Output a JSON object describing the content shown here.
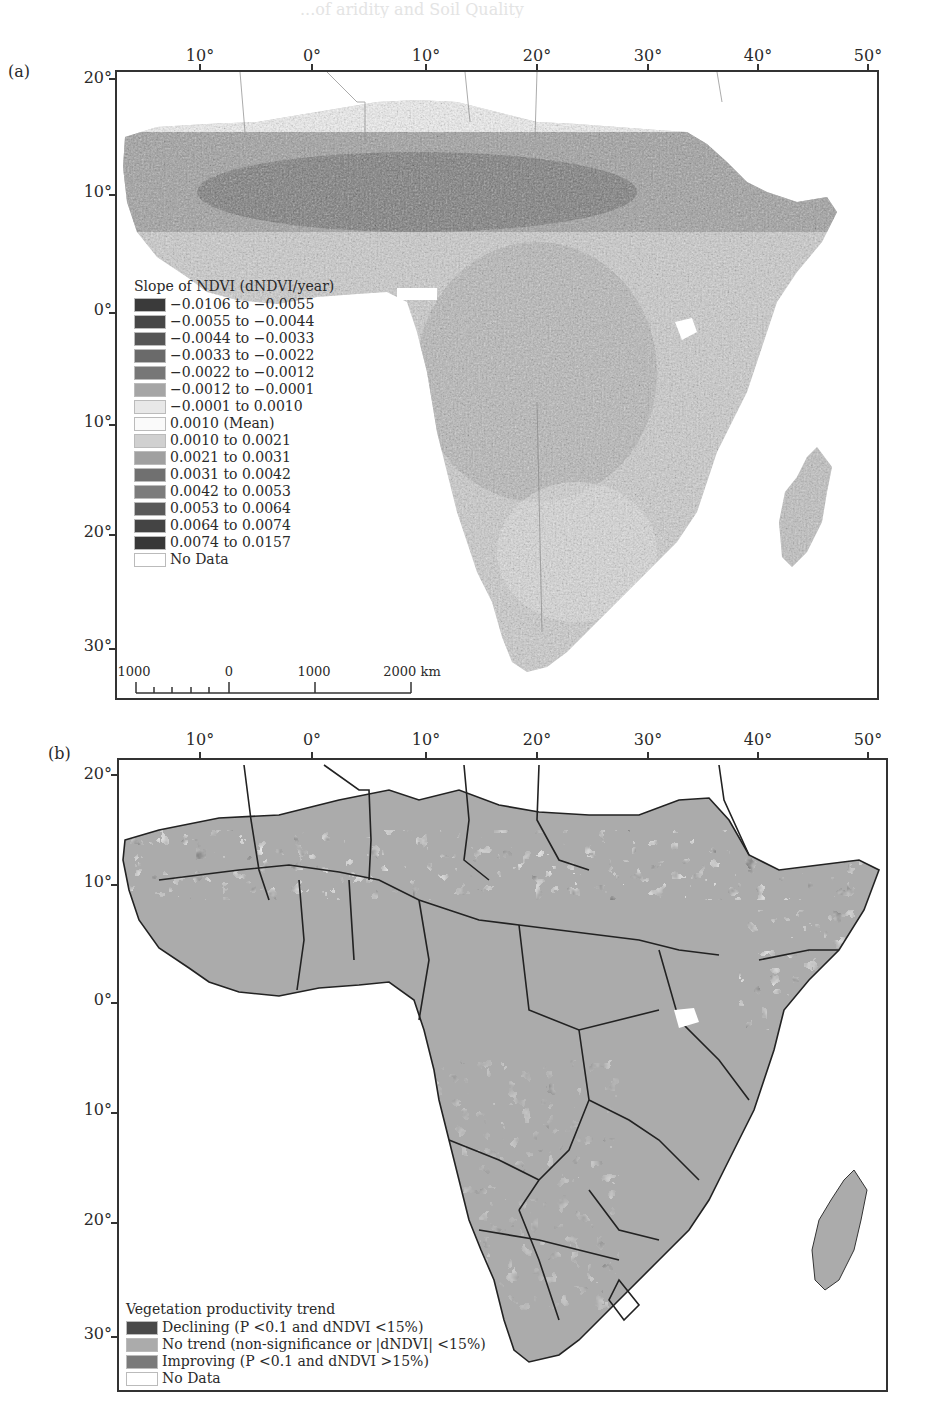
{
  "header_ghost_text": "...of aridity and Soil Quality",
  "panels": [
    {
      "id": "a",
      "label": "(a)",
      "lon_ticks": [
        "10°",
        "0°",
        "10°",
        "20°",
        "30°",
        "40°",
        "50°"
      ],
      "lat_ticks": [
        "20°",
        "10°",
        "0°",
        "10°",
        "20°",
        "30°"
      ],
      "legend": {
        "title": "Slope of NDVI (dNDVI/year)",
        "items": [
          {
            "label": "−0.0106 to −0.0055",
            "color": "#3a3a3a"
          },
          {
            "label": "−0.0055 to −0.0044",
            "color": "#474747"
          },
          {
            "label": "−0.0044 to −0.0033",
            "color": "#565656"
          },
          {
            "label": "−0.0033 to −0.0022",
            "color": "#6a6a6a"
          },
          {
            "label": "−0.0022 to −0.0012",
            "color": "#777777"
          },
          {
            "label": "−0.0012 to −0.0001",
            "color": "#a5a5a5"
          },
          {
            "label": "−0.0001 to 0.0010",
            "color": "#e8e8e8"
          },
          {
            "label": "0.0010 (Mean)",
            "color": "#fafafa"
          },
          {
            "label": "0.0010 to 0.0021",
            "color": "#d0d0d0"
          },
          {
            "label": "0.0021 to 0.0031",
            "color": "#a0a0a0"
          },
          {
            "label": "0.0031 to 0.0042",
            "color": "#707070"
          },
          {
            "label": "0.0042 to 0.0053",
            "color": "#7c7c7c"
          },
          {
            "label": "0.0053 to 0.0064",
            "color": "#5a5a5a"
          },
          {
            "label": "0.0064 to 0.0074",
            "color": "#444444"
          },
          {
            "label": "0.0074 to 0.0157",
            "color": "#383838"
          },
          {
            "label": "No Data",
            "color": "#ffffff"
          }
        ]
      },
      "scalebar": {
        "labels": [
          "1000",
          "0",
          "1000",
          "2000 km"
        ]
      }
    },
    {
      "id": "b",
      "label": "(b)",
      "lon_ticks": [
        "10°",
        "0°",
        "10°",
        "20°",
        "30°",
        "40°",
        "50°"
      ],
      "lat_ticks": [
        "20°",
        "10°",
        "0°",
        "10°",
        "20°",
        "30°"
      ],
      "legend": {
        "title": "Vegetation productivity trend",
        "items": [
          {
            "label": "Declining (P <0.1 and dNDVI <15%)",
            "color": "#4a4a4a"
          },
          {
            "label": "No trend (non-significance or |dNDVI| <15%)",
            "color": "#ababab"
          },
          {
            "label": "Improving (P <0.1 and dNDVI >15%)",
            "color": "#7a7a7a"
          },
          {
            "label": "No Data",
            "color": "#ffffff"
          }
        ]
      }
    }
  ]
}
